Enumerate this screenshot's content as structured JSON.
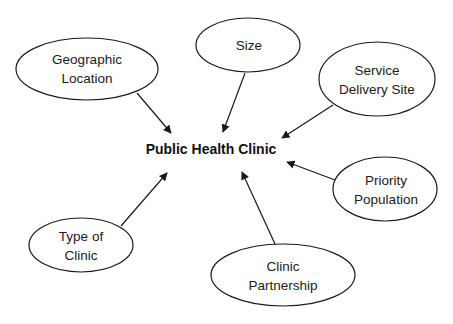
{
  "diagram": {
    "center": {
      "label": "Public Health Clinic",
      "x": 211,
      "y": 149
    },
    "nodes": [
      {
        "id": "geographic-location",
        "line1": "Geographic",
        "line2": "Location",
        "cx": 87,
        "cy": 69,
        "rx": 71,
        "ry": 31
      },
      {
        "id": "size",
        "line1": "Size",
        "line2": "",
        "cx": 248,
        "cy": 45,
        "rx": 52,
        "ry": 27
      },
      {
        "id": "service-delivery-site",
        "line1": "Service",
        "line2": "Delivery Site",
        "cx": 377,
        "cy": 79,
        "rx": 58,
        "ry": 37
      },
      {
        "id": "priority-population",
        "line1": "Priority",
        "line2": "Population",
        "cx": 385,
        "cy": 189,
        "rx": 52,
        "ry": 32
      },
      {
        "id": "type-of-clinic",
        "line1": "Type of",
        "line2": "Clinic",
        "cx": 81,
        "cy": 245,
        "rx": 52,
        "ry": 27
      },
      {
        "id": "clinic-partnership",
        "line1": "Clinic",
        "line2": "Partnership",
        "cx": 283,
        "cy": 275,
        "rx": 72,
        "ry": 31
      }
    ],
    "edges": [
      {
        "from": "geographic-location",
        "to": "public-health-clinic"
      },
      {
        "from": "size",
        "to": "public-health-clinic"
      },
      {
        "from": "service-delivery-site",
        "to": "public-health-clinic"
      },
      {
        "from": "priority-population",
        "to": "public-health-clinic"
      },
      {
        "from": "type-of-clinic",
        "to": "public-health-clinic"
      },
      {
        "from": "clinic-partnership",
        "to": "public-health-clinic"
      }
    ]
  }
}
